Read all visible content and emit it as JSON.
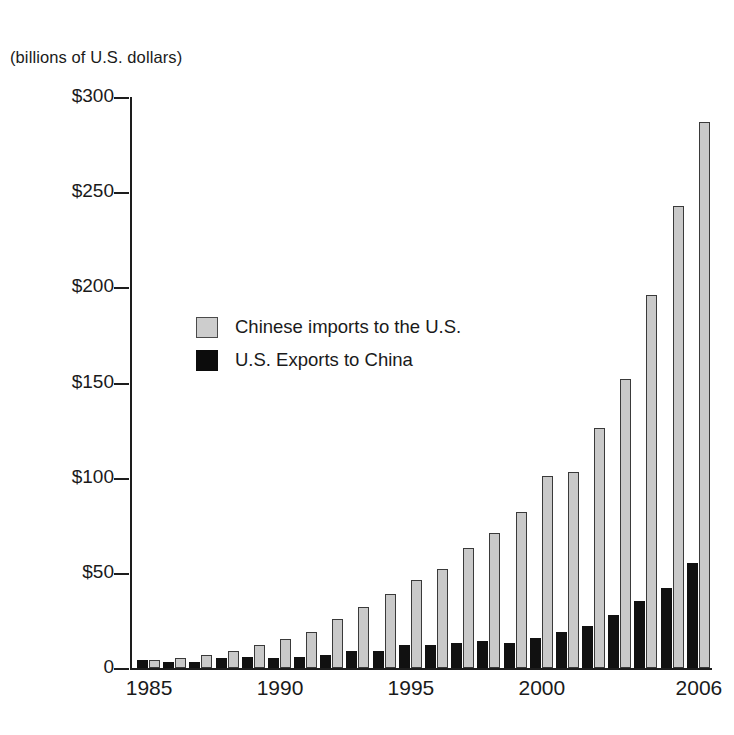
{
  "units_caption": "(billions of U.S. dollars)",
  "legend": {
    "position": "inside-upper-left",
    "entries": [
      {
        "label": "Chinese imports to the U.S.",
        "color": "#cdcdcd",
        "swatch": "imports-swatch"
      },
      {
        "label": "U.S. Exports to China",
        "color": "#0c0c0c",
        "swatch": "exports-swatch"
      }
    ]
  },
  "chart_data": {
    "type": "bar",
    "title": "",
    "subtitle": "",
    "xlabel": "",
    "ylabel": "(billions of U.S. dollars)",
    "ylim": [
      0,
      300
    ],
    "ytick_labels": [
      "0",
      "$50",
      "$100",
      "$150",
      "$200",
      "$250",
      "$300"
    ],
    "ytick_values": [
      0,
      50,
      100,
      150,
      200,
      250,
      300
    ],
    "xtick_labels": [
      "1985",
      "1990",
      "1995",
      "2000",
      "2006"
    ],
    "xtick_values": [
      1985,
      1990,
      1995,
      2000,
      2006
    ],
    "grid": false,
    "categories": [
      "1985",
      "1986",
      "1987",
      "1988",
      "1989",
      "1990",
      "1991",
      "1992",
      "1993",
      "1994",
      "1995",
      "1996",
      "1997",
      "1998",
      "1999",
      "2000",
      "2001",
      "2002",
      "2003",
      "2004",
      "2005",
      "2006"
    ],
    "series": [
      {
        "name": "U.S. Exports to China",
        "color": "#0c0c0c",
        "values": [
          4,
          3,
          3,
          5,
          6,
          5,
          6,
          7,
          9,
          9,
          12,
          12,
          13,
          14,
          13,
          16,
          19,
          22,
          28,
          35,
          42,
          55
        ]
      },
      {
        "name": "Chinese imports to the U.S.",
        "color": "#cdcdcd",
        "values": [
          4,
          5,
          7,
          9,
          12,
          15,
          19,
          26,
          32,
          39,
          46,
          52,
          63,
          71,
          82,
          101,
          103,
          126,
          152,
          196,
          243,
          287
        ]
      }
    ]
  }
}
